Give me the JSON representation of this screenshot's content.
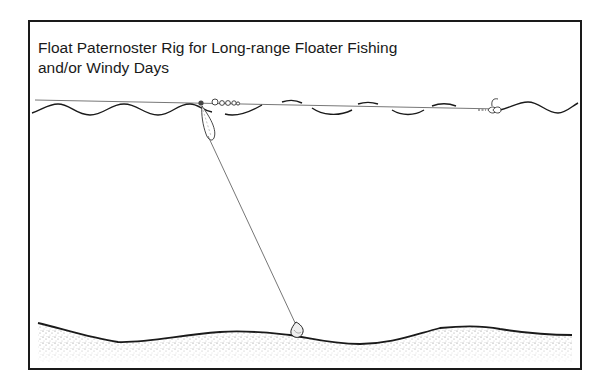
{
  "diagram": {
    "title_line1": "Float Paternoster Rig for Long-range Floater Fishing",
    "title_line2": "and/or Windy Days",
    "elements": [
      {
        "name": "water-surface",
        "description": "wavy water surface line"
      },
      {
        "name": "main-line",
        "description": "fishing line running across surface"
      },
      {
        "name": "float",
        "description": "elongated float at surface"
      },
      {
        "name": "controller-beads",
        "description": "beads/swivels on line near float"
      },
      {
        "name": "hook-bait",
        "description": "hook with floating bait near right"
      },
      {
        "name": "paternoster-line",
        "description": "line from float to lead on bottom"
      },
      {
        "name": "lead-weight",
        "description": "lead weight resting on lake bed"
      },
      {
        "name": "lake-bed",
        "description": "stippled bottom contour"
      }
    ],
    "colors": {
      "ink": "#1a1a1a",
      "line": "#555555",
      "stipple": "#888888"
    }
  }
}
